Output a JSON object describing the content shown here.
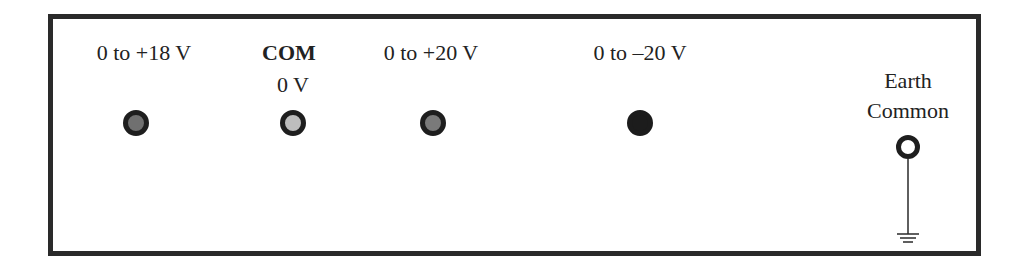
{
  "panel": {
    "terminals": [
      {
        "id": "plus18",
        "label": "0 to +18 V",
        "fill": "#707070",
        "ring": "#1e1e1e"
      },
      {
        "id": "com",
        "label": "COM",
        "sublabel": "0 V",
        "fill": "#bdbdbd",
        "ring": "#1e1e1e"
      },
      {
        "id": "plus20",
        "label": "0 to +20 V",
        "fill": "#7a7a7a",
        "ring": "#1e1e1e"
      },
      {
        "id": "minus20",
        "label": "0 to –20 V",
        "fill": "#1c1c1c",
        "ring": "#1c1c1c"
      }
    ],
    "earth": {
      "label_line1": "Earth",
      "label_line2": "Common",
      "fill": "#ffffff",
      "ring": "#1e1e1e"
    }
  },
  "colors": {
    "border": "#2a2a2a",
    "text": "#222222",
    "background": "#ffffff"
  }
}
